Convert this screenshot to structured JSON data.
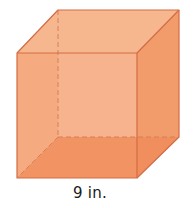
{
  "figure": {
    "shape": "cube",
    "edge_label": "9 in.",
    "edge_length": 9,
    "unit": "in.",
    "colors": {
      "top_face": "#F6B68E",
      "front_face": "#F4A679",
      "left_back_face": "#F7C0A0",
      "bottom_face": "#F08D5B",
      "right_face": "#F29B6B",
      "edge": "#D46C45",
      "hidden_edge": "#D4805A"
    },
    "vertices": {
      "front_top_left": [
        17,
        53
      ],
      "front_top_right": [
        137,
        53
      ],
      "front_bottom_left": [
        17,
        178
      ],
      "front_bottom_right": [
        137,
        178
      ],
      "back_top_left": [
        58,
        10
      ],
      "back_top_right": [
        179,
        10
      ],
      "back_bottom_left": [
        58,
        137
      ],
      "back_bottom_right": [
        179,
        137
      ]
    }
  }
}
